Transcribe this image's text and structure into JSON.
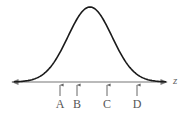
{
  "diagram": {
    "type": "normal-distribution-curve",
    "axis": {
      "label": "z",
      "y": 82,
      "x_start": 12,
      "x_end": 167,
      "color": "#777777"
    },
    "curve": {
      "peak_x": 90,
      "peak_y": 7,
      "sigma_px": 22,
      "color": "#1a1a1a"
    },
    "markers": [
      {
        "label": "A",
        "x": 60
      },
      {
        "label": "B",
        "x": 77
      },
      {
        "label": "C",
        "x": 107
      },
      {
        "label": "D",
        "x": 137
      }
    ],
    "marker_color": "#666666"
  }
}
